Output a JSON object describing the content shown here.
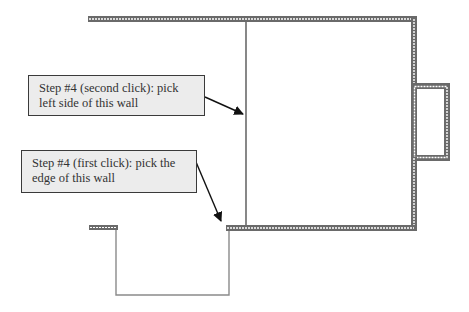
{
  "diagram": {
    "type": "floor-plan-instructions",
    "callouts": [
      {
        "id": "second-click",
        "lines": [
          "Step #4 (second click): pick",
          "left side of this wall"
        ],
        "target": "interior-wall-left-side"
      },
      {
        "id": "first-click",
        "lines": [
          "Step #4 (first click): pick the",
          "edge of this wall"
        ],
        "target": "bottom-wall-edge"
      }
    ],
    "colors": {
      "wall_outline": "#6a6a6a",
      "wall_fill": "#ffffff",
      "callout_fill": "#ececec",
      "callout_border": "#3a3a3a",
      "text": "#333333",
      "arrow": "#111111",
      "thin_line": "#8a8a8a"
    }
  }
}
